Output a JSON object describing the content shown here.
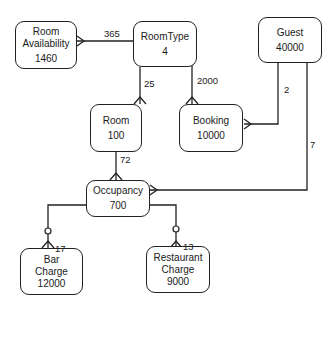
{
  "entities": {
    "room_availability": {
      "name_line1": "Room",
      "name_line2": "Availability",
      "count": "1460"
    },
    "roomtype": {
      "name": "RoomType",
      "count": "4"
    },
    "guest": {
      "name": "Guest",
      "count": "40000"
    },
    "room": {
      "name": "Room",
      "count": "100"
    },
    "booking": {
      "name": "Booking",
      "count": "10000"
    },
    "occupancy": {
      "name": "Occupancy",
      "count": "700"
    },
    "bar_charge": {
      "name_line1": "Bar",
      "name_line2": "Charge",
      "count": "12000"
    },
    "restaurant_charge": {
      "name_line1": "Restaurant",
      "name_line2": "Charge",
      "count": "9000"
    }
  },
  "relationships": [
    {
      "from": "RoomType",
      "to": "Room Availability",
      "label": "365"
    },
    {
      "from": "RoomType",
      "to": "Room",
      "label": "25"
    },
    {
      "from": "RoomType",
      "to": "Booking",
      "label": "2000"
    },
    {
      "from": "Guest",
      "to": "Booking",
      "label": "2"
    },
    {
      "from": "Guest",
      "to": "Occupancy",
      "label": "7"
    },
    {
      "from": "Room",
      "to": "Occupancy",
      "label": "72"
    },
    {
      "from": "Occupancy",
      "to": "Bar Charge",
      "label": "17"
    },
    {
      "from": "Occupancy",
      "to": "Restaurant Charge",
      "label": "13"
    }
  ]
}
